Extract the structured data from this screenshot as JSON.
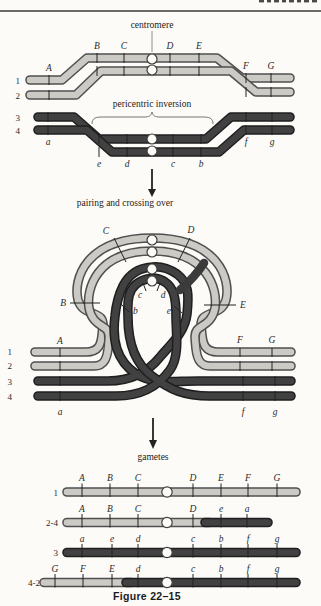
{
  "figure": {
    "caption": "Figure 22–15",
    "colors": {
      "light_chromosome": "#cbcac4",
      "dark_chromosome": "#3b3b3b",
      "tube_outline": "#4f4f4f",
      "background": "#fcfbf8"
    }
  },
  "annotations": {
    "centromere": "centromere",
    "pericentric_inversion": "pericentric inversion",
    "pairing_crossing": "pairing and crossing over",
    "gametes": "gametes"
  },
  "top_section": {
    "row_labels": [
      "1",
      "2",
      "3",
      "4"
    ],
    "markers": {
      "A": "A",
      "B": "B",
      "C": "C",
      "D": "D",
      "E": "E",
      "F": "F",
      "G": "G",
      "a": "a",
      "b": "b",
      "c": "c",
      "d": "d",
      "e": "e",
      "f": "f",
      "g": "g"
    }
  },
  "middle_section": {
    "row_labels": [
      "1",
      "2",
      "3",
      "4"
    ],
    "markers": {
      "A": "A",
      "B": "B",
      "C": "C",
      "D": "D",
      "E": "E",
      "F": "F",
      "G": "G",
      "a": "a",
      "b": "b",
      "c": "c",
      "d": "d",
      "e": "e",
      "f": "f",
      "g": "g"
    }
  },
  "gamete_section": {
    "rows": [
      {
        "label": "1",
        "markers": [
          "A",
          "B",
          "C",
          "D",
          "E",
          "F",
          "G"
        ]
      },
      {
        "label": "2-4",
        "markers": [
          "A",
          "B",
          "C",
          "D",
          "e",
          "a"
        ]
      },
      {
        "label": "3",
        "markers": [
          "a",
          "e",
          "d",
          "c",
          "b",
          "f",
          "g"
        ]
      },
      {
        "label": "4-2",
        "markers": [
          "G",
          "F",
          "E",
          "d",
          "c",
          "b",
          "f",
          "g"
        ]
      }
    ]
  }
}
